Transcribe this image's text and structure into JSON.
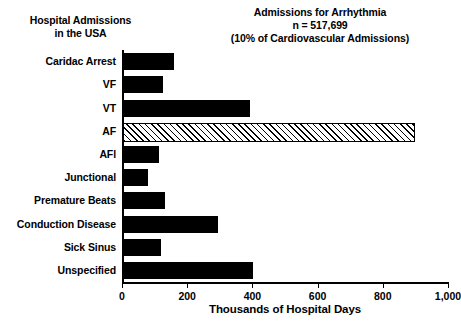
{
  "header": {
    "left_line1": "Hospital Admissions",
    "left_line2": "in the USA",
    "right_line1": "Admissions for Arrhythmia",
    "right_line2": "n = 517,699",
    "right_line3": "(10% of Cardiovascular Admissions)"
  },
  "chart_data": {
    "type": "bar",
    "orientation": "horizontal",
    "title": "Admissions for Arrhythmia",
    "subtitle": "n = 517,699 (10% of Cardiovascular Admissions)",
    "xlabel": "Thousands of Hospital Days",
    "ylabel": "Hospital Admissions in the USA",
    "xlim": [
      0,
      1000
    ],
    "xticks": [
      0,
      200,
      400,
      600,
      800,
      1000
    ],
    "xticklabels": [
      "0",
      "200",
      "400",
      "600",
      "800",
      "1,000"
    ],
    "grid": false,
    "legend": "none",
    "categories": [
      "Caridac Arrest",
      "VF",
      "VT",
      "AF",
      "AFl",
      "Junctional",
      "Premature Beats",
      "Conduction Disease",
      "Sick Sinus",
      "Unspecified"
    ],
    "values": [
      155,
      122,
      390,
      890,
      110,
      78,
      128,
      290,
      118,
      400
    ],
    "bar_styles": [
      "solid-black",
      "solid-black",
      "solid-black",
      "hatched",
      "solid-black",
      "solid-black",
      "solid-black",
      "solid-black",
      "solid-black",
      "solid-black"
    ],
    "colors": {
      "bar_fill": "#000000",
      "hatch_fill": "#ffffff",
      "hatch_line": "#000000",
      "axis": "#000000",
      "background": "#ffffff"
    }
  }
}
